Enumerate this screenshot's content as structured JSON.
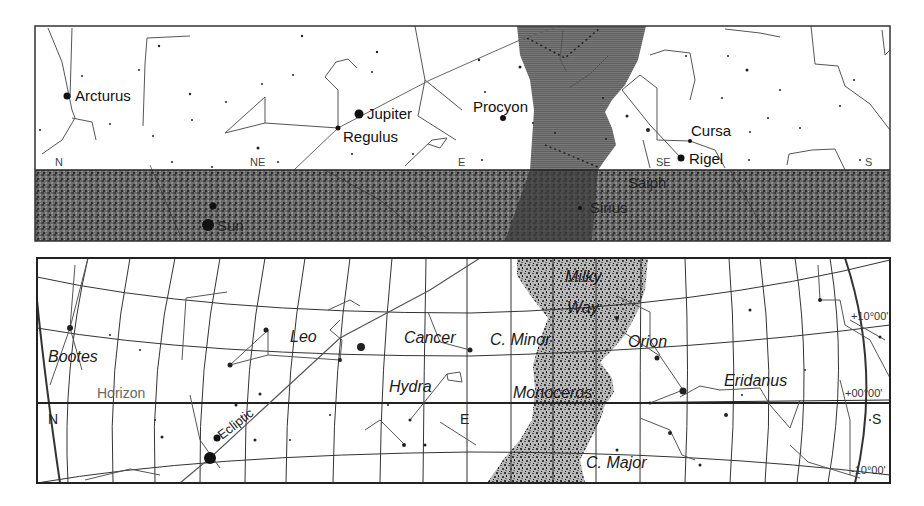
{
  "figure": {
    "panels": [
      {
        "id": "top",
        "kind": "horizon-view",
        "frame": {
          "x": 35,
          "y": 26,
          "w": 855,
          "h": 215
        },
        "horizon_y": 170,
        "ground_color": "#5a5a5a",
        "milky_way_color": "#777777",
        "compass": [
          {
            "label": "N",
            "x": 55,
            "y": 166
          },
          {
            "label": "NE",
            "x": 250,
            "y": 166
          },
          {
            "label": "E",
            "x": 458,
            "y": 166
          },
          {
            "label": "SE",
            "x": 656,
            "y": 166
          },
          {
            "label": "S",
            "x": 865,
            "y": 166
          }
        ],
        "stars_labeled": [
          {
            "label": "Arcturus",
            "x": 67,
            "y": 96,
            "r": 3.5,
            "lx": 75,
            "ly": 101
          },
          {
            "label": "Jupiter",
            "x": 359,
            "y": 114,
            "r": 4.5,
            "lx": 367,
            "ly": 119
          },
          {
            "label": "Regulus",
            "x": 338,
            "y": 128,
            "r": 2.5,
            "lx": 343,
            "ly": 142
          },
          {
            "label": "Procyon",
            "x": 503,
            "y": 118,
            "r": 3,
            "lx": 473,
            "ly": 112
          },
          {
            "label": "Cursa",
            "x": 690,
            "y": 141,
            "r": 2,
            "lx": 691,
            "ly": 136
          },
          {
            "label": "Rigel",
            "x": 681,
            "y": 158,
            "r": 3.5,
            "lx": 689,
            "ly": 164
          }
        ],
        "stars_below_horizon": [
          {
            "label": "Sun",
            "x": 208,
            "y": 225,
            "r": 6,
            "lx": 217,
            "ly": 231
          },
          {
            "label": "Saiph",
            "x": 628,
            "y": 182,
            "r": 0,
            "lx": 628,
            "ly": 188
          },
          {
            "label": "Sirius",
            "x": 580,
            "y": 208,
            "r": 2,
            "lx": 590,
            "ly": 213
          }
        ]
      },
      {
        "id": "bottom",
        "kind": "grid-view",
        "frame": {
          "x": 37,
          "y": 258,
          "w": 853,
          "h": 225
        },
        "milky_way_color": "#8a8a8a",
        "compass": [
          {
            "label": "N",
            "x": 48,
            "y": 424
          },
          {
            "label": "E",
            "x": 460,
            "y": 424
          },
          {
            "label": "S",
            "x": 872,
            "y": 424
          }
        ],
        "constellations": [
          {
            "label": "Bootes",
            "x": 48,
            "y": 362
          },
          {
            "label": "Leo",
            "x": 290,
            "y": 342
          },
          {
            "label": "Cancer",
            "x": 404,
            "y": 343
          },
          {
            "label": "C. Minor",
            "x": 490,
            "y": 345
          },
          {
            "label": "Milky",
            "x": 565,
            "y": 282
          },
          {
            "label": "Way",
            "x": 567,
            "y": 313
          },
          {
            "label": "Orion",
            "x": 628,
            "y": 347
          },
          {
            "label": "Hydra",
            "x": 389,
            "y": 392
          },
          {
            "label": "Monoceros",
            "x": 513,
            "y": 398
          },
          {
            "label": "Eridanus",
            "x": 724,
            "y": 386
          },
          {
            "label": "C. Major",
            "x": 586,
            "y": 468
          }
        ],
        "annotations": {
          "horizon_label": {
            "text": "Horizon",
            "x": 97,
            "y": 398
          },
          "ecliptic_label": {
            "text": "Ecliptic",
            "x": 222,
            "y": 440,
            "rotate": -38
          }
        },
        "declination_labels": [
          {
            "text": "+10°00'",
            "x": 851,
            "y": 320
          },
          {
            "text": "+00°00'",
            "x": 845,
            "y": 397
          },
          {
            "text": "-10°00'",
            "x": 851,
            "y": 474
          }
        ]
      }
    ],
    "ecliptic_color": "#555555",
    "line_color": "#444444"
  }
}
